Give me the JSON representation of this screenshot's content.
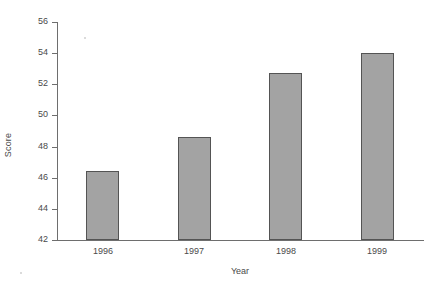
{
  "chart_data": {
    "type": "bar",
    "title": "",
    "xlabel": "Year",
    "ylabel": "Score",
    "categories": [
      "1996",
      "1997",
      "1998",
      "1999"
    ],
    "values": [
      46.45,
      48.6,
      52.7,
      54.0
    ],
    "ylim": [
      42,
      56
    ],
    "yticks": [
      42,
      44,
      46,
      48,
      50,
      52,
      54,
      56
    ],
    "ytick_labels": [
      "42",
      "44",
      "46",
      "48",
      "50",
      "52",
      "54",
      "56"
    ],
    "grid": false,
    "legend": null,
    "bar_color": "#a3a3a3",
    "bar_edge_color": "#545454",
    "background_color": "#ffffff",
    "axis_color": "#6e6e6e",
    "text_color": "#4a4a4a"
  }
}
